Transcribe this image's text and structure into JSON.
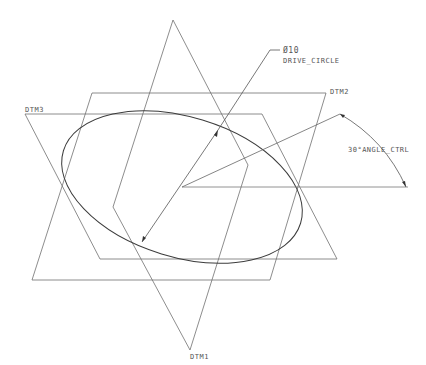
{
  "diagram": {
    "type": "CAD sketch with datum planes",
    "colors": {
      "line": "#666666",
      "curve": "#444444",
      "background": "#ffffff"
    },
    "datums": [
      {
        "name": "DTM1",
        "points": "173,20 248,165 190,350 113,207"
      },
      {
        "name": "DTM2",
        "points": "92,93 326,93 270,280 32,280"
      },
      {
        "name": "DTM3",
        "points": "25,114 262,114 337,259 100,259"
      }
    ],
    "labels": {
      "dtm1": "DTM1",
      "dtm2": "DTM2",
      "dtm3": "DTM3",
      "diameter": "Ø10",
      "drive_circle": "DRIVE_CIRCLE",
      "angle": "30°ANGLE_CTRL"
    },
    "ellipse": {
      "cx": 182,
      "cy": 185,
      "rx": 122,
      "ry": 70,
      "rotate": 17
    },
    "center": {
      "x": 182,
      "y": 187
    },
    "angle_dimension": {
      "value_deg": 30,
      "name": "ANGLE_CTRL"
    }
  }
}
